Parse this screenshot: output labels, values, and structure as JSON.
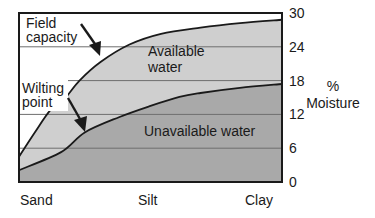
{
  "chart_data": {
    "type": "area",
    "title": "",
    "xlabel": "",
    "ylabel": "% Moisture",
    "ylabel_lines": [
      "%",
      "Moisture"
    ],
    "ylim": [
      0,
      30
    ],
    "y_ticks": [
      0,
      6,
      12,
      18,
      24,
      30
    ],
    "y_axis_position": "right",
    "grid": {
      "horizontal": true,
      "values": [
        6,
        12,
        18,
        24
      ]
    },
    "x_categories": [
      "Sand",
      "Silt",
      "Clay"
    ],
    "x_positions": [
      0,
      0.5,
      1
    ],
    "series": [
      {
        "name": "Field capacity",
        "x": [
          0,
          0.06,
          0.12,
          0.17,
          0.23,
          0.31,
          0.42,
          0.54,
          0.69,
          0.84,
          1.0
        ],
        "values": [
          4.5,
          8.8,
          12.8,
          14.6,
          18.0,
          21.3,
          24.4,
          26.3,
          27.4,
          28.2,
          28.8
        ]
      },
      {
        "name": "Wilting point",
        "x": [
          0,
          0.16,
          0.25,
          0.38,
          0.5,
          0.61,
          0.69,
          0.84,
          1.0
        ],
        "values": [
          2.1,
          5.3,
          8.8,
          11.5,
          13.5,
          15.1,
          15.8,
          16.7,
          17.4
        ]
      }
    ],
    "regions": [
      {
        "name": "Available water",
        "between": [
          "Wilting point",
          "Field capacity"
        ],
        "color": "#cfcfcf"
      },
      {
        "name": "Unavailable water",
        "between": [
          "baseline",
          "Wilting point"
        ],
        "color": "#a9a9a9"
      }
    ],
    "annotations": {
      "field_capacity_label": [
        "Field",
        "capacity"
      ],
      "wilting_point_label": [
        "Wilting",
        "point"
      ],
      "available_water_label": [
        "Available",
        "water"
      ],
      "unavailable_water_label": "Unavailable water"
    },
    "colors": {
      "background": "#ffffff",
      "available": "#cfcfcf",
      "unavailable": "#a9a9a9",
      "line": "#1a1a1a",
      "grid": "#6e6e6e"
    }
  }
}
